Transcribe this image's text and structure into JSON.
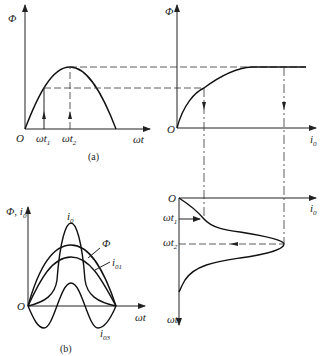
{
  "figure": {
    "panel_a": {
      "caption": "(a)",
      "y_label": "Φ",
      "origin": "O",
      "x_label": "ωt",
      "ticks": [
        {
          "base": "ωt",
          "sub": "1"
        },
        {
          "base": "ωt",
          "sub": "2"
        }
      ]
    },
    "magnetization": {
      "y_label": "Φ",
      "origin": "O",
      "x_label": "i",
      "x_sub": "0"
    },
    "current_wave": {
      "origin": "O",
      "x_label": "i",
      "x_sub": "0",
      "y_label": "ωt",
      "ticks": [
        {
          "base": "ωt",
          "sub": "1"
        },
        {
          "base": "ωt",
          "sub": "2"
        }
      ]
    },
    "panel_b": {
      "caption": "(b)",
      "y_label": "Φ, i",
      "y_sub": "0",
      "origin": "O",
      "x_label": "ωt",
      "curves": [
        {
          "name": "i",
          "sub": "0"
        },
        {
          "name": "Φ",
          "sub": ""
        },
        {
          "name": "i",
          "sub": "01"
        },
        {
          "name": "i",
          "sub": "03"
        }
      ]
    }
  }
}
